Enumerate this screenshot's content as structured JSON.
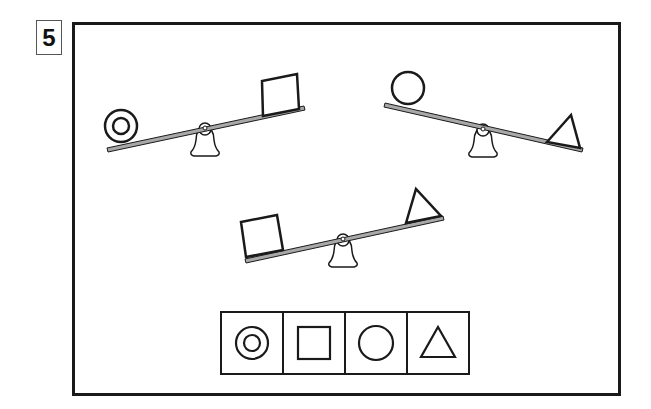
{
  "question": {
    "number": "5"
  },
  "colors": {
    "stroke": "#1a1a1a",
    "beam_fill": "#a8a8a8",
    "background": "#ffffff"
  },
  "seesaws": [
    {
      "id": "seesaw-1",
      "left_object": "double-circle",
      "right_object": "square",
      "heavier_side": "left",
      "beam": {
        "x1": 107,
        "y1": 150,
        "x2": 304,
        "y2": 108
      },
      "fulcrum": {
        "x": 205,
        "y": 129
      }
    },
    {
      "id": "seesaw-2",
      "left_object": "circle",
      "right_object": "triangle",
      "heavier_side": "right",
      "beam": {
        "x1": 385,
        "y1": 105,
        "x2": 582,
        "y2": 151
      },
      "fulcrum": {
        "x": 483,
        "y": 130
      }
    },
    {
      "id": "seesaw-3",
      "left_object": "square",
      "right_object": "triangle",
      "heavier_side": "left",
      "beam": {
        "x1": 245,
        "y1": 261,
        "x2": 443,
        "y2": 218
      },
      "fulcrum": {
        "x": 343,
        "y": 240
      }
    }
  ],
  "answer_choices": [
    {
      "shape": "double-circle",
      "label": "double circle"
    },
    {
      "shape": "square",
      "label": "square"
    },
    {
      "shape": "circle",
      "label": "circle"
    },
    {
      "shape": "triangle",
      "label": "triangle"
    }
  ]
}
